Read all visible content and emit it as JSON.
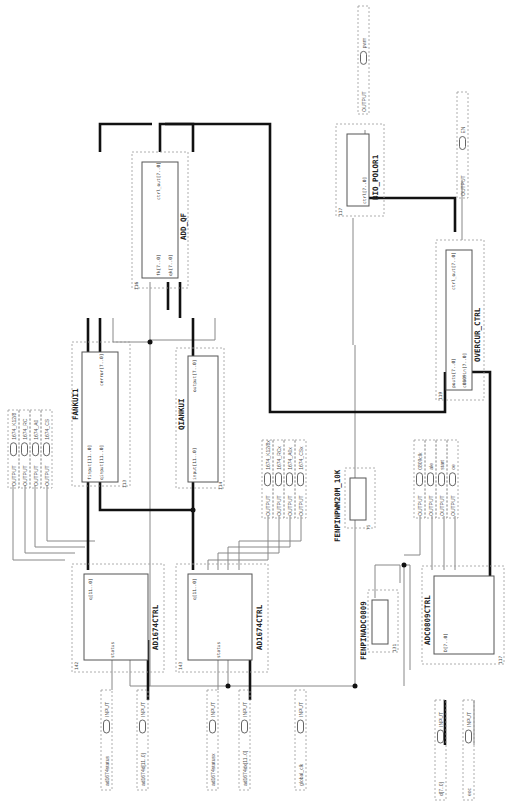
{
  "diagram": {
    "type": "FPGA block schematic (rotated 90°)",
    "blocks": [
      {
        "id": "ad1674_1",
        "name": "AD1674CTRL",
        "inst": "142",
        "ports_top": [
          "q[11..0]",
          "k12x8",
          "rc",
          "a0",
          "ce",
          "clkn"
        ],
        "ports_bottom": [
          "status",
          "clk",
          "D[11..0]"
        ]
      },
      {
        "id": "ad1674_2",
        "name": "AD1674CTRL",
        "inst": "143",
        "ports_top": [
          "q[11..0]",
          "k12x8",
          "rc",
          "a0",
          "ce",
          "clkn"
        ],
        "ports_bottom": [
          "status",
          "clk",
          "D[11..0]"
        ]
      },
      {
        "id": "fankui",
        "name": "FANKUI1",
        "inst": "113",
        "ports_left": [
          "finput[11..0]",
          "qinput[11..0]",
          "clk"
        ],
        "ports_right": [
          "cerror[7..0]"
        ]
      },
      {
        "id": "qiankui",
        "name": "QIANKUI",
        "inst": "114",
        "ports_left": [
          "input[11..0]",
          "clk"
        ],
        "ports_right": [
          "output[7..0]"
        ]
      },
      {
        "id": "addqf",
        "name": "ADD_QF",
        "inst": "116",
        "ports_left": [
          "clk",
          "fk[7..0]",
          "qk[7..0]"
        ],
        "ports_right": [
          "ctrl_out[7..0]"
        ]
      },
      {
        "id": "biopolor",
        "name": "BIO_POLOR1",
        "inst": "117",
        "ports_left": [
          "clk",
          "ctrl[7..0]"
        ],
        "ports_right": [
          "pwm"
        ]
      },
      {
        "id": "overcur",
        "name": "OVERCUR_CTRL",
        "inst": "119",
        "ports_left": [
          "pouts[7..0]",
          "c0809in[7..0]"
        ],
        "ports_right": [
          "ctrl_out[7..0]",
          "en"
        ]
      },
      {
        "id": "fenpin10k",
        "name": "FENPINPWM20M_10K",
        "inst": "75",
        "ports_left": [
          "clk"
        ],
        "ports_right": [
          "fout"
        ]
      },
      {
        "id": "fenpinadc",
        "name": "FENPINADC0809",
        "inst": "131",
        "ports_left": [
          "clk"
        ],
        "ports_right": [
          "fout"
        ]
      },
      {
        "id": "adc0809",
        "name": "ADC0809CTRL",
        "inst": "117",
        "ports_top": [
          "ale",
          "start",
          "oe",
          "q[7..0]"
        ],
        "ports_bottom": [
          "D[7..0]",
          "clk",
          "eoc"
        ]
      }
    ],
    "inputs": [
      {
        "name": "ad1674status",
        "type": "INPUT",
        "tag": "VCC"
      },
      {
        "name": "ad1674d[11..0]",
        "type": "INPUT",
        "tag": "VCC"
      },
      {
        "name": "ad1674statusx",
        "type": "INPUT",
        "tag": "VCC"
      },
      {
        "name": "ad1674dx[11..0]",
        "type": "INPUT",
        "tag": "VCC"
      },
      {
        "name": "global_clk",
        "type": "INPUT",
        "tag": "VCC"
      },
      {
        "name": "d[7..0]",
        "type": "INPUT",
        "tag": "VCC"
      },
      {
        "name": "eoc",
        "type": "INPUT",
        "tag": "VCC"
      }
    ],
    "outputs_group1": [
      "1674_K12/8",
      "1674_RC",
      "1674_A0",
      "1674_CS"
    ],
    "outputs_group2": [
      "1674_K12/8x",
      "1674_RCx",
      "1674_A0x",
      "1674_CSx"
    ],
    "outputs_group3": [
      "0809clk",
      "ale",
      "start",
      "oe"
    ],
    "outputs_single": [
      "pwm",
      "EN"
    ],
    "output_type": "OUTPUT",
    "input_type": "INPUT",
    "vcc": "VCC"
  }
}
